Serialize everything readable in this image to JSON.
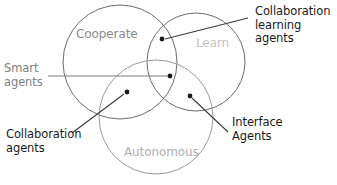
{
  "diagram": {
    "type": "venn-3-circle",
    "title_visible": false,
    "background_color": "#ffffff",
    "circles": [
      {
        "key": "cooperate",
        "label": "Cooperate",
        "label_color": "#8a8a8a",
        "stroke_color": "#6b6b6b",
        "cx": 120,
        "cy": 62,
        "r": 57
      },
      {
        "key": "learn",
        "label": "Learn",
        "label_color": "#c2c2c2",
        "stroke_color": "#6b6b6b",
        "cx": 196,
        "cy": 62,
        "r": 49
      },
      {
        "key": "autonomous",
        "label": "Autonomous",
        "label_color": "#b0b0b0",
        "stroke_color": "#9a9a9a",
        "cx": 156,
        "cy": 117,
        "r": 57
      }
    ],
    "callouts": [
      {
        "key": "smart-agents",
        "label": "Smart\nagents",
        "color": "#808080",
        "region": "center-all-three",
        "target_x": 170,
        "target_y": 76,
        "line_from_x": 48,
        "line_from_y": 76
      },
      {
        "key": "collaboration-learning-agents",
        "label": "Collaboration\nlearning\nagents",
        "color": "#1a1a1a",
        "region": "cooperate-learn",
        "target_x": 162,
        "target_y": 39,
        "line_from_x": 248,
        "line_from_y": 18
      },
      {
        "key": "collaboration-agents",
        "label": "Collaboration\nagents",
        "color": "#1a1a1a",
        "region": "cooperate-autonomous",
        "target_x": 127,
        "target_y": 92,
        "line_from_x": 72,
        "line_from_y": 133
      },
      {
        "key": "interface-agents",
        "label": "Interface\nAgents",
        "color": "#1a1a1a",
        "region": "learn-autonomous",
        "target_x": 190,
        "target_y": 96,
        "line_from_x": 228,
        "line_from_y": 132
      }
    ]
  }
}
